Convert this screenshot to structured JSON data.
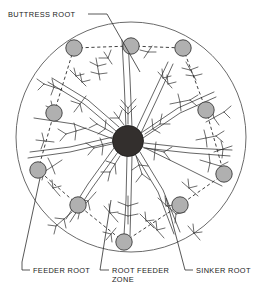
{
  "figure": {
    "title_visible": false,
    "background": "#ffffff",
    "ink_color": "#3a3a3a",
    "text_color": "#1a1a1a"
  },
  "zone": {
    "name": "root-feeder-zone-boundary",
    "shape": "circle",
    "center_x": 131,
    "center_y": 137,
    "radius": 115,
    "stroke": "#6b6b6b",
    "fill": "none"
  },
  "trunk": {
    "name": "trunk-cross-section",
    "center_x": 128,
    "center_y": 141,
    "radius": 15.5,
    "fill": "#332f2d",
    "stroke": "#1a1a1a"
  },
  "sinker_roots": {
    "fill": "#b0b0b0",
    "stroke": "#3a3a3a",
    "radius": 8.2,
    "count": 10,
    "points": [
      {
        "id": "sinker-1",
        "x": 74,
        "y": 48
      },
      {
        "id": "sinker-2",
        "x": 131,
        "y": 46
      },
      {
        "id": "sinker-3",
        "x": 183,
        "y": 48
      },
      {
        "id": "sinker-4",
        "x": 54,
        "y": 113
      },
      {
        "id": "sinker-5",
        "x": 206,
        "y": 110
      },
      {
        "id": "sinker-6",
        "x": 38,
        "y": 170
      },
      {
        "id": "sinker-7",
        "x": 224,
        "y": 174
      },
      {
        "id": "sinker-8",
        "x": 78,
        "y": 205
      },
      {
        "id": "sinker-9",
        "x": 180,
        "y": 205
      },
      {
        "id": "sinker-10",
        "x": 124,
        "y": 242
      }
    ],
    "dashed_links": [
      [
        0,
        1
      ],
      [
        1,
        2
      ],
      [
        2,
        4
      ],
      [
        4,
        6
      ],
      [
        6,
        8
      ],
      [
        8,
        9
      ],
      [
        9,
        7
      ],
      [
        7,
        5
      ],
      [
        5,
        3
      ],
      [
        3,
        0
      ]
    ]
  },
  "labels": [
    {
      "id": "label-buttress-root",
      "text": "BUTTRESS ROOT",
      "x": 8,
      "y": 17,
      "anchor": "start",
      "leader": "M 88 14 L 107 14 L 140 72"
    },
    {
      "id": "label-feeder-root",
      "text": "FEEDER ROOT",
      "x": 33,
      "y": 273,
      "anchor": "start",
      "leader": "M 30 270 L 22 270 L 22 262 L 40 178"
    },
    {
      "id": "label-root-feeder-zone",
      "text": "ROOT FEEDER",
      "text2": "ZONE",
      "x": 112,
      "y": 273,
      "y2": 282,
      "anchor": "start",
      "leader": "M 109 270 L 100 270 L 111 200"
    },
    {
      "id": "label-sinker-root",
      "text": "SINKER ROOT",
      "x": 196,
      "y": 273,
      "anchor": "start",
      "leader": "M 193 270 L 185 270 L 166 198"
    }
  ],
  "root_structure": {
    "description": "radiating lateral buttress roots drawn as double lines with fine feathery feeder-root branches",
    "lateral_count": 9,
    "stroke": "#4a4a4a"
  }
}
